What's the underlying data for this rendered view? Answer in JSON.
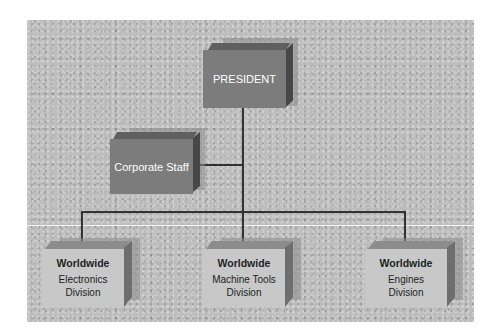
{
  "diagram": {
    "type": "org-chart",
    "president": {
      "label": "PRESIDENT"
    },
    "staff": {
      "label": "Corporate Staff"
    },
    "divisions": [
      {
        "title": "Worldwide",
        "name": "Electronics Division",
        "line1": "Electronics",
        "line2": "Division"
      },
      {
        "title": "Worldwide",
        "name": "Machine Tools Division",
        "line1": "Machine Tools",
        "line2": "Division"
      },
      {
        "title": "Worldwide",
        "name": "Engines Division",
        "line1": "Engines",
        "line2": "Division"
      }
    ]
  },
  "colors": {
    "background": "#bdbdbd",
    "box_dark": "#7c7c7c",
    "box_light": "#c8c8c8",
    "connector": "#333333"
  }
}
